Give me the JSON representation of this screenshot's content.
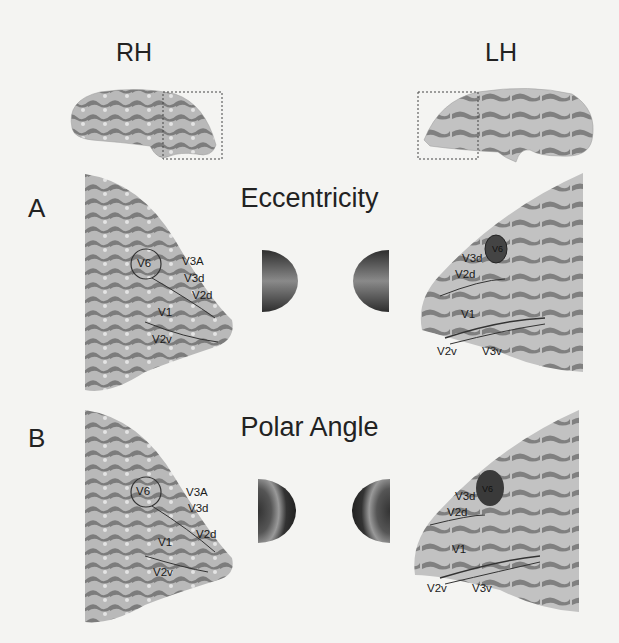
{
  "hemispheres": {
    "right": "RH",
    "left": "LH"
  },
  "panels": [
    {
      "letter": "A",
      "title": "Eccentricity",
      "stimulus_icon": "eccentricity-wedge-gradient",
      "rh_labels": [
        "V6",
        "V3A",
        "V3d",
        "V2d",
        "V1",
        "V2v"
      ],
      "lh_labels": [
        "V6",
        "V3d",
        "V2d",
        "V1",
        "V2v",
        "V3v"
      ]
    },
    {
      "letter": "B",
      "title": "Polar Angle",
      "stimulus_icon": "polar-angle-ring-gradient",
      "rh_labels": [
        "V6",
        "V3A",
        "V3d",
        "V2d",
        "V1",
        "V2v"
      ],
      "lh_labels": [
        "V6",
        "V3d",
        "V2d",
        "V1",
        "V2v",
        "V3v"
      ]
    }
  ],
  "colors": {
    "background": "#f4f4f2",
    "gyri": "#b8b8b8",
    "sulci": "#7a7a7a",
    "text": "#222222"
  }
}
